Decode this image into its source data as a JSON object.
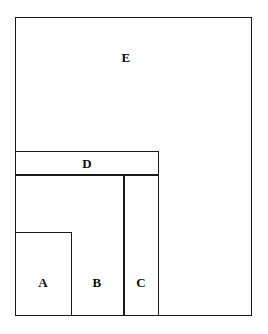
{
  "figure": {
    "background_color": "#ffffff",
    "line_color": "#1a1a1a",
    "label_color": "#0f0f0f",
    "canvas": {
      "width": 268,
      "height": 334
    },
    "rectangles": [
      {
        "id": "E",
        "label": "E",
        "left": 15,
        "top": 17,
        "width": 237,
        "height": 299,
        "label_x": 126,
        "label_y": 57
      },
      {
        "id": "D",
        "label": "D",
        "left": 15,
        "top": 151,
        "width": 144,
        "height": 24,
        "label_x": 87,
        "label_y": 163
      },
      {
        "id": "B",
        "label": "B",
        "left": 15,
        "top": 175,
        "width": 109,
        "height": 141,
        "label_x": 97,
        "label_y": 282
      },
      {
        "id": "C",
        "label": "C",
        "left": 124,
        "top": 175,
        "width": 35,
        "height": 141,
        "label_x": 141,
        "label_y": 282
      },
      {
        "id": "A",
        "label": "A",
        "left": 15,
        "top": 232,
        "width": 57,
        "height": 84,
        "label_x": 43,
        "label_y": 282
      }
    ]
  }
}
